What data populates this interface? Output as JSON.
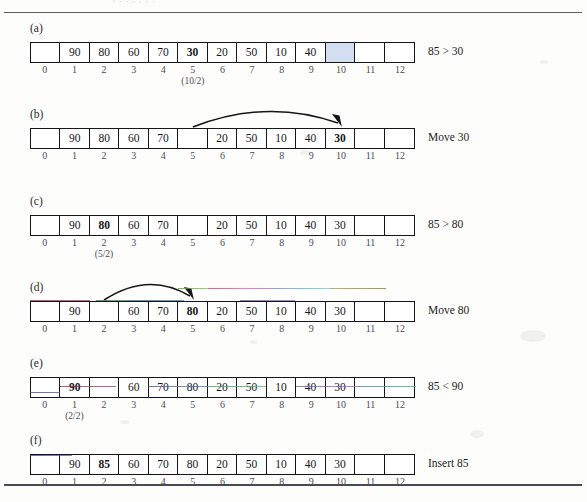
{
  "figure": {
    "clipped_caption": "·  ·    ·  ·  ·  ·  ·",
    "index_labels": [
      "0",
      "1",
      "2",
      "3",
      "4",
      "5",
      "6",
      "7",
      "8",
      "9",
      "10",
      "11",
      "12"
    ],
    "highlight_color": "#d3dff0"
  },
  "panels": [
    {
      "label": "(a)",
      "cells": [
        "",
        "90",
        "80",
        "60",
        "70",
        "30",
        "20",
        "50",
        "10",
        "40",
        "",
        "",
        ""
      ],
      "bold_index": 5,
      "highlight_index": 10,
      "sub_label": {
        "index": 5,
        "text": "(10/2)"
      },
      "operation": "85 > 30",
      "arrow": null
    },
    {
      "label": "(b)",
      "cells": [
        "",
        "90",
        "80",
        "60",
        "70",
        "",
        "20",
        "50",
        "10",
        "40",
        "30",
        "",
        ""
      ],
      "bold_index": 10,
      "highlight_index": null,
      "sub_label": null,
      "operation": "Move 30",
      "arrow": {
        "from_index": 5,
        "to_index": 10
      }
    },
    {
      "label": "(c)",
      "cells": [
        "",
        "90",
        "80",
        "60",
        "70",
        "",
        "20",
        "50",
        "10",
        "40",
        "30",
        "",
        ""
      ],
      "bold_index": 2,
      "highlight_index": null,
      "sub_label": {
        "index": 2,
        "text": "(5/2)"
      },
      "operation": "85 > 80",
      "arrow": null
    },
    {
      "label": "(d)",
      "cells": [
        "",
        "90",
        "",
        "60",
        "70",
        "80",
        "20",
        "50",
        "10",
        "40",
        "30",
        "",
        ""
      ],
      "bold_index": 5,
      "highlight_index": null,
      "sub_label": null,
      "operation": "Move 80",
      "arrow": {
        "from_index": 2,
        "to_index": 5
      }
    },
    {
      "label": "(e)",
      "cells": [
        "",
        "90",
        "",
        "60",
        "70",
        "80",
        "20",
        "50",
        "10",
        "40",
        "30",
        "",
        ""
      ],
      "bold_index": 1,
      "highlight_index": null,
      "sub_label": {
        "index": 1,
        "text": "(2/2)"
      },
      "operation": "85 < 90",
      "arrow": null
    },
    {
      "label": "(f)",
      "cells": [
        "",
        "90",
        "85",
        "60",
        "70",
        "80",
        "20",
        "50",
        "10",
        "40",
        "30",
        "",
        ""
      ],
      "bold_index": 2,
      "highlight_index": null,
      "sub_label": null,
      "operation": "Insert 85",
      "arrow": null
    }
  ]
}
